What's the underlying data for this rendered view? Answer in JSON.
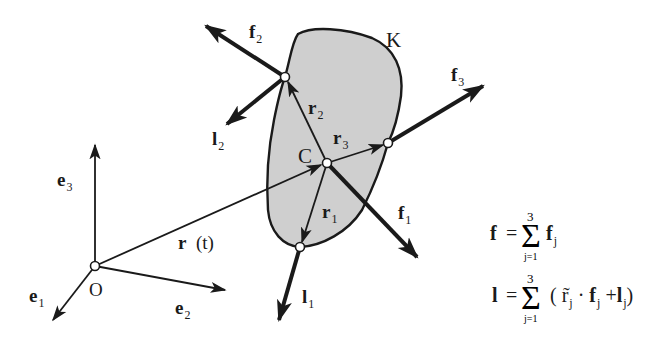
{
  "diagram": {
    "colors": {
      "body_fill": "#cfcfcf",
      "stroke": "#1a1a1a",
      "node_fill": "#ffffff",
      "background": "#ffffff"
    },
    "origin": {
      "label": "O"
    },
    "basis": [
      {
        "name": "e",
        "sub": "1"
      },
      {
        "name": "e",
        "sub": "2"
      },
      {
        "name": "e",
        "sub": "3"
      }
    ],
    "position_vector": {
      "name": "r",
      "arg": "(t)"
    },
    "body": {
      "label": "K"
    },
    "center": {
      "label": "C"
    },
    "relative_vectors": [
      {
        "name": "r",
        "sub": "1"
      },
      {
        "name": "r",
        "sub": "2"
      },
      {
        "name": "r",
        "sub": "3"
      }
    ],
    "forces": [
      {
        "name": "f",
        "sub": "1"
      },
      {
        "name": "f",
        "sub": "2"
      },
      {
        "name": "f",
        "sub": "3"
      }
    ],
    "torques": [
      {
        "name": "l",
        "sub": "1"
      },
      {
        "name": "l",
        "sub": "2"
      }
    ]
  },
  "equations": {
    "force_sum": {
      "lhs": "f",
      "equals": "=",
      "sum_upper": "3",
      "sum_lower": "j=1",
      "term": "f",
      "term_sub": "j"
    },
    "torque_sum": {
      "lhs": "l",
      "equals": "=",
      "sum_upper": "3",
      "sum_lower": "j=1",
      "open": "(",
      "r_tilde": "r̃",
      "r_sub": "j",
      "dot": "·",
      "f": "f",
      "f_sub": "j",
      "plus": "+",
      "l": "l",
      "l_sub": "j",
      "close": ")"
    }
  }
}
